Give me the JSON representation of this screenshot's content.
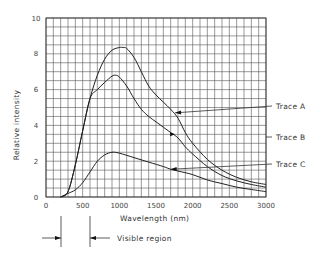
{
  "chart_data": {
    "type": "line",
    "title": "",
    "xlabel": "Wavelength (nm)",
    "ylabel": "Relative intensity",
    "xlim": [
      0,
      3000
    ],
    "ylim": [
      0,
      10
    ],
    "grid": true,
    "grid_step": {
      "x": 100,
      "y": 0.5
    },
    "xticks": [
      0,
      500,
      1000,
      1500,
      2000,
      2500,
      3000
    ],
    "yticks": [
      0,
      2,
      4,
      6,
      8,
      10
    ],
    "legend_position": "right, leader-line labels",
    "series": [
      {
        "name": "Trace A",
        "x": [
          200,
          300,
          400,
          500,
          600,
          700,
          800,
          900,
          1000,
          1050,
          1100,
          1200,
          1300,
          1400,
          1500,
          1600,
          1700,
          1800,
          1900,
          2000,
          2200,
          2400,
          2600,
          2800,
          3000
        ],
        "values": [
          0,
          0.3,
          1.8,
          3.7,
          5.5,
          6.8,
          7.7,
          8.2,
          8.35,
          8.35,
          8.3,
          7.8,
          7.0,
          6.2,
          5.7,
          5.3,
          4.9,
          4.4,
          3.6,
          3.0,
          2.1,
          1.5,
          1.1,
          0.85,
          0.7
        ]
      },
      {
        "name": "Trace B",
        "x": [
          200,
          300,
          400,
          500,
          600,
          700,
          800,
          900,
          950,
          1000,
          1100,
          1200,
          1300,
          1400,
          1500,
          1600,
          1700,
          1800,
          1900,
          2000,
          2200,
          2400,
          2600,
          2800,
          3000
        ],
        "values": [
          0,
          0.3,
          1.8,
          3.7,
          5.5,
          6.0,
          6.4,
          6.75,
          6.8,
          6.7,
          6.2,
          5.5,
          4.9,
          4.5,
          4.2,
          3.9,
          3.6,
          3.3,
          2.8,
          2.4,
          1.7,
          1.2,
          0.9,
          0.7,
          0.55
        ]
      },
      {
        "name": "Trace C",
        "x": [
          200,
          300,
          400,
          500,
          600,
          700,
          800,
          900,
          1000,
          1200,
          1400,
          1600,
          1700,
          1800,
          2000,
          2200,
          2400,
          2600,
          2800,
          3000
        ],
        "values": [
          0,
          0.2,
          0.4,
          0.8,
          1.4,
          2.0,
          2.35,
          2.5,
          2.45,
          2.2,
          1.95,
          1.7,
          1.55,
          1.45,
          1.25,
          0.95,
          0.75,
          0.55,
          0.42,
          0.3
        ]
      }
    ],
    "annotations": [
      {
        "text": "Trace A",
        "arrow_to": [
          1760,
          4.7
        ]
      },
      {
        "text": "Trace B",
        "arrow_to": [
          1760,
          3.5
        ]
      },
      {
        "text": "Trace C",
        "arrow_to": [
          1700,
          1.55
        ]
      },
      {
        "text": "Visible region",
        "range_nm": [
          400,
          700
        ]
      }
    ]
  }
}
